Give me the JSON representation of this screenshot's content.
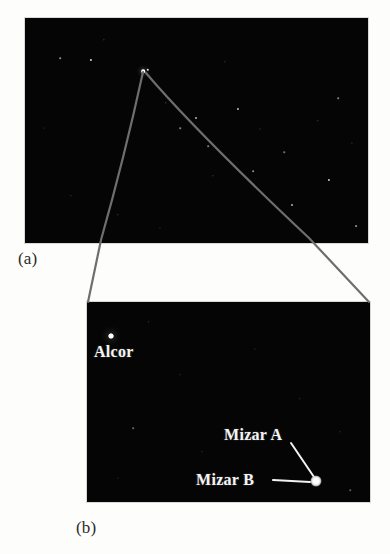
{
  "figure": {
    "type": "astronomical-photograph-pair",
    "page_background": "#fdfdfb",
    "sky_background": "#050505"
  },
  "panels": [
    {
      "id": "a",
      "caption": "(a)",
      "description": "Wide-field sky photograph with callout lines converging on the Mizar-Alcor pair",
      "rect": {
        "x": 25,
        "y": 18,
        "w": 343,
        "h": 225
      }
    },
    {
      "id": "b",
      "caption": "(b)",
      "description": "Magnified view of the Mizar-Alcor region",
      "rect": {
        "x": 87,
        "y": 302,
        "w": 283,
        "h": 200
      }
    }
  ],
  "star_labels": [
    {
      "id": "alcor",
      "text": "Alcor",
      "x": 94,
      "y": 343,
      "has_leader": false
    },
    {
      "id": "mizar-a",
      "text": "Mizar A",
      "x": 224,
      "y": 426,
      "has_leader": true
    },
    {
      "id": "mizar-b",
      "text": "Mizar B",
      "x": 196,
      "y": 471,
      "has_leader": true
    }
  ],
  "marked_stars": [
    {
      "id": "alcor-dot",
      "x": 111,
      "y": 336,
      "size": 5,
      "brightness": "moderate"
    },
    {
      "id": "mizar-blob",
      "x": 316,
      "y": 481,
      "size": 11,
      "brightness": "bright"
    }
  ],
  "leader_lines": [
    {
      "from_label": "mizar-a",
      "x1": 291,
      "y1": 443,
      "x2": 314,
      "y2": 477,
      "color": "#f2f2f2"
    },
    {
      "from_label": "mizar-b",
      "x1": 273,
      "y1": 480,
      "x2": 310,
      "y2": 482,
      "color": "#f2f2f2"
    }
  ],
  "callout_lines": {
    "color": "#6e6e6e",
    "apex": {
      "x": 143,
      "y": 72
    },
    "left_curve": "M 143 72 C 133 118, 118 180, 101 240 L 88 302",
    "right_curve": "M 146 73 C 186 120, 258 190, 309 238 L 369 302"
  },
  "panel_a_stars": [
    {
      "x": 60,
      "y": 58,
      "size": 1.6,
      "opacity": 0.55
    },
    {
      "x": 91,
      "y": 60,
      "size": 2.2,
      "opacity": 0.85
    },
    {
      "x": 104,
      "y": 40,
      "size": 1.3,
      "opacity": 0.4
    },
    {
      "x": 143,
      "y": 71,
      "size": 3.6,
      "opacity": 1.0
    },
    {
      "x": 148,
      "y": 70,
      "size": 2.4,
      "opacity": 0.9
    },
    {
      "x": 166,
      "y": 103,
      "size": 1.4,
      "opacity": 0.45
    },
    {
      "x": 180,
      "y": 128,
      "size": 1.5,
      "opacity": 0.5
    },
    {
      "x": 196,
      "y": 118,
      "size": 2.0,
      "opacity": 0.7
    },
    {
      "x": 208,
      "y": 146,
      "size": 1.6,
      "opacity": 0.5
    },
    {
      "x": 213,
      "y": 176,
      "size": 1.3,
      "opacity": 0.4
    },
    {
      "x": 238,
      "y": 109,
      "size": 2.1,
      "opacity": 0.75
    },
    {
      "x": 253,
      "y": 171,
      "size": 1.7,
      "opacity": 0.55
    },
    {
      "x": 260,
      "y": 129,
      "size": 1.2,
      "opacity": 0.35
    },
    {
      "x": 284,
      "y": 152,
      "size": 1.5,
      "opacity": 0.45
    },
    {
      "x": 292,
      "y": 205,
      "size": 2.0,
      "opacity": 0.7
    },
    {
      "x": 318,
      "y": 121,
      "size": 1.4,
      "opacity": 0.4
    },
    {
      "x": 329,
      "y": 180,
      "size": 2.2,
      "opacity": 0.8
    },
    {
      "x": 338,
      "y": 98,
      "size": 1.6,
      "opacity": 0.5
    },
    {
      "x": 352,
      "y": 143,
      "size": 1.2,
      "opacity": 0.35
    },
    {
      "x": 356,
      "y": 226,
      "size": 1.8,
      "opacity": 0.55
    },
    {
      "x": 44,
      "y": 128,
      "size": 1.2,
      "opacity": 0.3
    },
    {
      "x": 71,
      "y": 196,
      "size": 1.3,
      "opacity": 0.35
    },
    {
      "x": 118,
      "y": 215,
      "size": 1.4,
      "opacity": 0.4
    },
    {
      "x": 160,
      "y": 228,
      "size": 1.2,
      "opacity": 0.3
    },
    {
      "x": 225,
      "y": 62,
      "size": 1.3,
      "opacity": 0.35
    }
  ],
  "panel_b_stars": [
    {
      "x": 111,
      "y": 336,
      "size": 5.0,
      "opacity": 1.0
    },
    {
      "x": 149,
      "y": 322,
      "size": 1.4,
      "opacity": 0.35
    },
    {
      "x": 180,
      "y": 375,
      "size": 1.3,
      "opacity": 0.3
    },
    {
      "x": 133,
      "y": 428,
      "size": 1.6,
      "opacity": 0.4
    },
    {
      "x": 202,
      "y": 452,
      "size": 1.3,
      "opacity": 0.3
    },
    {
      "x": 255,
      "y": 349,
      "size": 1.2,
      "opacity": 0.28
    },
    {
      "x": 300,
      "y": 399,
      "size": 1.4,
      "opacity": 0.32
    },
    {
      "x": 340,
      "y": 432,
      "size": 1.3,
      "opacity": 0.3
    },
    {
      "x": 118,
      "y": 478,
      "size": 1.2,
      "opacity": 0.28
    },
    {
      "x": 350,
      "y": 490,
      "size": 1.5,
      "opacity": 0.35
    }
  ]
}
